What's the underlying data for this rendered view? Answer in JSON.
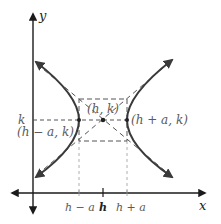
{
  "diagram": {
    "axes": {
      "x_label": "x",
      "y_label": "y"
    },
    "y_tick_label": "k",
    "x_tick_labels": [
      "h − a",
      "h",
      "h + a"
    ],
    "points": {
      "center": "(h, k)",
      "left_vertex": "(h − a, k)",
      "right_vertex": "(h + a, k)"
    },
    "colors": {
      "curve": "#3a3a3a",
      "axes": "#1a1a1a",
      "dashed": "#555555",
      "light_dashed": "#9a9a9a",
      "label": "#5a5a5a"
    }
  }
}
